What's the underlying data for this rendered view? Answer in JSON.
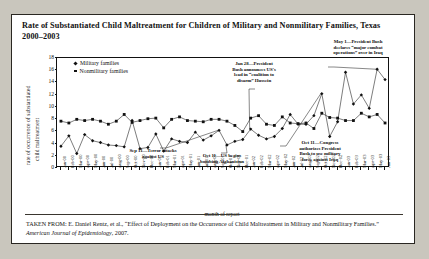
{
  "figure": {
    "title": "Rate of Substantiated Child Maltreatment for Children of Military and  Nonmilitary Families, Texas 2000–2003",
    "source_prefix": "TAKEN FROM: E. Daniel Rentz, et al., “Effect of Deployment on the Occurrence of Child Maltreatment in Military and Nonmilitary Families.” ",
    "source_italic": "American Journal of Epidemiology",
    "source_suffix": ", 2007."
  },
  "chart_data": {
    "type": "line",
    "title": "Rate of Substantiated Child Maltreatment for Children of Military and  Nonmilitary Families, Texas 2000–2003",
    "xlabel": "month of report",
    "ylabel": "rate of occurrence of substantiated child maltreatment",
    "ylabel_line1": "rate of occurrence of substantiated",
    "ylabel_line2": "child maltreatment",
    "ylim": [
      0,
      18
    ],
    "yticks": [
      0,
      2,
      4,
      6,
      8,
      10,
      12,
      14,
      16,
      18
    ],
    "grid": false,
    "legend_position": "top-left-inside",
    "categories": [
      "Jan-00",
      "Feb-00",
      "Mar-00",
      "Apr-00",
      "May-00",
      "Jun-00",
      "Jul-00",
      "Aug-00",
      "Sep-00",
      "Oct-00",
      "Nov-00",
      "Dec-00",
      "Jan-01",
      "Feb-01",
      "Mar-01",
      "Apr-01",
      "May-01",
      "Jun-01",
      "Jul-01",
      "Aug-01",
      "Sep-01",
      "Oct-01",
      "Nov-01",
      "Dec-01",
      "Jan-02",
      "Feb-02",
      "Mar-02",
      "Apr-02",
      "May-02",
      "Jun-02",
      "Jul-02",
      "Aug-02",
      "Sep-02",
      "Oct-02",
      "Nov-02",
      "Dec-02",
      "Jan-03",
      "Feb-03",
      "Mar-03",
      "Apr-03",
      "May-03",
      "Jun-03"
    ],
    "series": [
      {
        "name": "Military families",
        "marker": "diamond",
        "values": [
          3.4,
          5.1,
          2.2,
          5.3,
          4.3,
          4.0,
          3.6,
          3.5,
          3.3,
          7.6,
          3.0,
          3.2,
          5.4,
          2.6,
          4.6,
          4.2,
          4.0,
          5.7,
          4.4,
          5.1,
          6.0,
          3.6,
          4.2,
          4.5,
          6.2,
          5.2,
          4.6,
          5.0,
          6.3,
          8.6,
          7.0,
          7.0,
          8.4,
          12.0,
          5.0,
          7.4,
          15.5,
          10.3,
          11.8,
          9.6,
          16.0,
          14.3
        ]
      },
      {
        "name": "Nonmilitary families",
        "marker": "square",
        "values": [
          7.5,
          7.2,
          7.8,
          7.6,
          7.8,
          7.5,
          7.0,
          7.5,
          8.6,
          7.3,
          7.6,
          7.9,
          8.0,
          6.4,
          7.8,
          8.2,
          7.6,
          7.5,
          7.4,
          7.8,
          7.8,
          7.5,
          6.8,
          5.8,
          8.0,
          8.4,
          7.0,
          6.8,
          8.2,
          7.2,
          7.1,
          7.2,
          6.3,
          8.8,
          8.1,
          8.0,
          7.6,
          7.6,
          8.8,
          8.2,
          8.6,
          7.2
        ]
      }
    ],
    "annotations": [
      {
        "id": "sep11",
        "label": "Sep 11—Terror attacks against US",
        "lines": [
          "Sep 11—Terror attacks",
          "against US"
        ],
        "target_category": "Sep-01"
      },
      {
        "id": "oct11-afghanistan",
        "label": "Oct 11—US begins bombing Afghanistan",
        "lines": [
          "Oct 11—US begins",
          "bombing Afghanistan"
        ],
        "target_category": "Oct-01"
      },
      {
        "id": "jan28-coalition",
        "label": "Jan 28—President Bush announces US's lead in “coalition to disarm” Hussein",
        "lines": [
          "Jan 28—President",
          "Bush announces US's",
          "lead in “coalition to",
          "disarm” Hussein"
        ],
        "target_category": "Jan-02"
      },
      {
        "id": "oct11-congress",
        "label": "Oct 11—Congress authorizes President Bush to use military force against Iraq",
        "lines": [
          "Oct 11—Congress",
          "authorizes President",
          "Bush to use military",
          "force against Iraq"
        ],
        "target_category": "Oct-02"
      },
      {
        "id": "may1-major-combat",
        "label": "May 1—President Bush declares “major combat operations” over in Iraq",
        "lines": [
          "May 1—President Bush",
          "declares “major combat",
          "operations” over in Iraq"
        ],
        "target_category": "May-03"
      }
    ]
  },
  "colors": {
    "ink": "#111111",
    "paper": "#ffffff",
    "page": "#c9c6bd",
    "border": "#2a2722"
  }
}
